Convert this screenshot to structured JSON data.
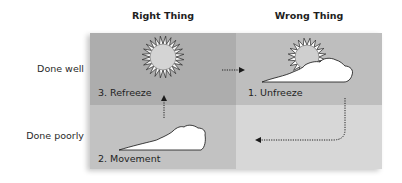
{
  "columns": [
    {
      "label": "Right Thing"
    },
    {
      "label": "Wrong Thing"
    }
  ],
  "rows": [
    {
      "label": "Done well"
    },
    {
      "label": "Done poorly"
    }
  ],
  "quadrants": [
    {
      "id": "right-well",
      "step": "3. Refreeze",
      "icon": "sun-icon",
      "color": "#adadad"
    },
    {
      "id": "wrong-well",
      "step": "1. Unfreeze",
      "icon": "sun-behind-cloud-icon",
      "color": "#bebebe"
    },
    {
      "id": "right-poorly",
      "step": "2. Movement",
      "icon": "cloud-icon",
      "color": "#c2c2c2"
    },
    {
      "id": "wrong-poorly",
      "step": "",
      "icon": "",
      "color": "#d7d7d7"
    }
  ],
  "arrows": [
    {
      "from": "1. Unfreeze",
      "to": "2. Movement",
      "style": "dotted"
    },
    {
      "from": "2. Movement",
      "to": "3. Refreeze",
      "style": "dotted"
    },
    {
      "from": "3. Refreeze",
      "to": "1. Unfreeze",
      "style": "dotted"
    }
  ]
}
